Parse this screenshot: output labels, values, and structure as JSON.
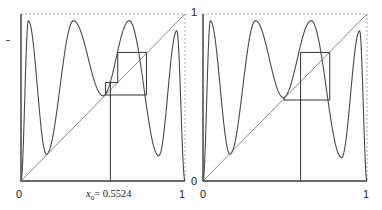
{
  "chart_data": [
    {
      "type": "line",
      "title": "",
      "subtitle": "Cobweb diagram, left panel",
      "xlabel": "",
      "ylabel": "",
      "xlim": [
        0,
        1
      ],
      "ylim": [
        0,
        1
      ],
      "grid": false,
      "x_tick_labels": [
        "0",
        "1"
      ],
      "y_tick_labels": [],
      "annotation": "x₀ = 0.5524",
      "x0": 0.5524,
      "series": [
        {
          "name": "map f(x)",
          "extrema": [
            [
              0,
              0
            ],
            [
              0.045,
              0.96
            ],
            [
              0.155,
              0.16
            ],
            [
              0.32,
              0.96
            ],
            [
              0.5,
              0.51
            ],
            [
              0.66,
              0.96
            ],
            [
              0.84,
              0.15
            ],
            [
              0.95,
              0.9
            ],
            [
              1,
              0
            ]
          ]
        },
        {
          "name": "diagonal y=x",
          "points": [
            [
              0,
              0
            ],
            [
              1,
              1
            ]
          ]
        },
        {
          "name": "cobweb",
          "points": [
            [
              0.545,
              0
            ],
            [
              0.545,
              0.59
            ],
            [
              0.59,
              0.59
            ],
            [
              0.59,
              0.77
            ],
            [
              0.765,
              0.77
            ],
            [
              0.765,
              0.515
            ],
            [
              0.515,
              0.515
            ],
            [
              0.515,
              0.59
            ],
            [
              0.545,
              0.59
            ]
          ]
        }
      ]
    },
    {
      "type": "line",
      "title": "",
      "subtitle": "Cobweb diagram, right panel",
      "xlabel": "",
      "ylabel": "",
      "xlim": [
        0,
        1
      ],
      "ylim": [
        0,
        1
      ],
      "grid": false,
      "x_tick_labels": [
        "0",
        "1"
      ],
      "y_tick_labels": [
        "0",
        "1"
      ],
      "series": [
        {
          "name": "map f(x)",
          "extrema": [
            [
              0,
              0
            ],
            [
              0.045,
              0.96
            ],
            [
              0.165,
              0.16
            ],
            [
              0.32,
              0.96
            ],
            [
              0.49,
              0.5
            ],
            [
              0.66,
              0.96
            ],
            [
              0.845,
              0.14
            ],
            [
              0.955,
              0.9
            ],
            [
              1,
              0
            ]
          ]
        },
        {
          "name": "diagonal y=x",
          "points": [
            [
              0,
              0
            ],
            [
              1,
              1
            ]
          ]
        },
        {
          "name": "cobweb",
          "points": [
            [
              0.595,
              0
            ],
            [
              0.595,
              0.77
            ],
            [
              0.773,
              0.77
            ],
            [
              0.773,
              0.485
            ],
            [
              0.494,
              0.485
            ],
            [
              0.494,
              0.5
            ]
          ]
        }
      ]
    }
  ],
  "labels": {
    "left_x_min": "0",
    "left_x_max": "1",
    "left_x0": "x",
    "left_x0_sub": "0",
    "left_x0_value": "= 0.5524",
    "right_x_min": "0",
    "right_x_max": "1",
    "right_y_min": "0",
    "right_y_max": "1"
  },
  "colors": {
    "frame": "#3a3a3a",
    "curve": "#4a4a4a",
    "diagonal": "#6a6a6a",
    "cobweb": "#333333",
    "dashed_border": "#aaaaaa"
  }
}
